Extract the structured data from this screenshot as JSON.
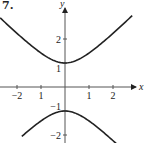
{
  "problem_number": "7.",
  "chart_data": {
    "type": "line",
    "title": "",
    "equation": "y^2 - x^2 = 1",
    "xlabel": "x",
    "ylabel": "y",
    "xlim": [
      -2.7,
      2.9
    ],
    "ylim": [
      -2.3,
      3.6
    ],
    "grid": false,
    "x_ticks": [
      -2,
      -1,
      1,
      2
    ],
    "x_tick_labels": [
      "−2",
      "1",
      "1",
      "2"
    ],
    "y_ticks": [
      2,
      1,
      -1,
      -2
    ],
    "y_tick_labels": [
      "2",
      "1",
      "−1",
      "−2"
    ],
    "series": [
      {
        "name": "upper branch",
        "x": [
          -2.7,
          -2,
          -1,
          0,
          1,
          2,
          2.8
        ],
        "y": [
          2.88,
          2.24,
          1.41,
          1.0,
          1.41,
          2.24,
          2.97
        ]
      },
      {
        "name": "lower branch",
        "x": [
          -1.8,
          -1,
          0,
          1,
          2.3
        ],
        "y": [
          -2.06,
          -1.41,
          -1.0,
          -1.41,
          -2.51
        ]
      }
    ],
    "style": {
      "color": "#222222",
      "background": "#ffffff"
    }
  },
  "layout": {
    "origin_px": [
      65,
      87
    ],
    "unit_px": 24
  }
}
